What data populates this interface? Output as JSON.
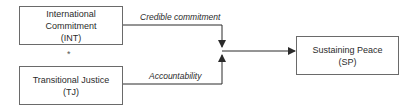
{
  "nodes": {
    "int": {
      "title": "International Commitment",
      "abbr": "(INT)"
    },
    "tj": {
      "title": "Transitional Justice",
      "abbr": "(TJ)"
    },
    "sp": {
      "title": "Sustaining Peace",
      "abbr": "(SP)"
    }
  },
  "operator": "*",
  "edges": {
    "int_label": "Credible commitment",
    "tj_label": "Accountability"
  },
  "colors": {
    "line": "#2b2b2b",
    "border": "#6a6a6a"
  }
}
